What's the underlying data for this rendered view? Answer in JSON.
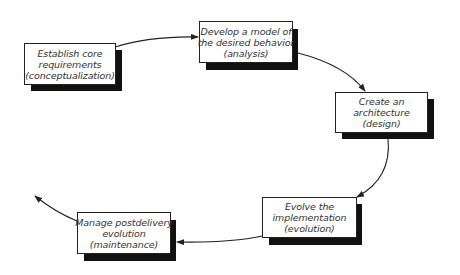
{
  "diagram": {
    "type": "cycle",
    "colors": {
      "background": "#ffffff",
      "box_fill": "#ffffff",
      "box_border": "#222222",
      "shadow": "#111111",
      "arrow": "#222222"
    },
    "nodes": [
      {
        "id": "conceptualization",
        "lines": [
          "Establish core",
          "requirements",
          "(conceptualization)"
        ]
      },
      {
        "id": "analysis",
        "lines": [
          "Develop a model of",
          "the desired behavior",
          "(analysis)"
        ]
      },
      {
        "id": "design",
        "lines": [
          "Create an",
          "architecture",
          "(design)"
        ]
      },
      {
        "id": "evolution",
        "lines": [
          "Evolve the",
          "implementation",
          "(evolution)"
        ]
      },
      {
        "id": "maintenance",
        "lines": [
          "Manage postdelivery",
          "evolution",
          "(maintenance)"
        ]
      }
    ],
    "edges": [
      {
        "from": "conceptualization",
        "to": "analysis"
      },
      {
        "from": "analysis",
        "to": "design"
      },
      {
        "from": "design",
        "to": "evolution"
      },
      {
        "from": "evolution",
        "to": "maintenance"
      },
      {
        "from": "maintenance",
        "to": "outgoing"
      }
    ]
  }
}
